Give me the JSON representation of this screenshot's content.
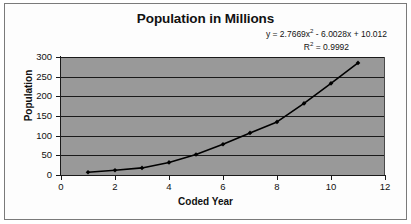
{
  "chart_data": {
    "type": "scatter",
    "title": "Population in Millions",
    "xlabel": "Coded Year",
    "ylabel": "Population",
    "xlim": [
      0,
      12
    ],
    "ylim": [
      0,
      300
    ],
    "xticks": [
      0,
      2,
      4,
      6,
      8,
      10,
      12
    ],
    "yticks": [
      0,
      50,
      100,
      150,
      200,
      250,
      300
    ],
    "xtick_labels": [
      "0",
      "2",
      "4",
      "6",
      "8",
      "10",
      "12"
    ],
    "ytick_labels": [
      "0",
      "50",
      "100",
      "150",
      "200",
      "250",
      "300"
    ],
    "grid": "horizontal",
    "legend": "none",
    "plot_background": "#999999",
    "series_color": "#000000",
    "marker": "diamond",
    "x": [
      1,
      2,
      3,
      4,
      5,
      6,
      7,
      8,
      9,
      10,
      11
    ],
    "values": [
      7,
      12,
      18,
      32,
      52,
      78,
      107,
      135,
      182,
      233,
      285
    ],
    "trendline": {
      "type": "polynomial",
      "order": 2,
      "a": 2.7669,
      "b": -6.0028,
      "c": 10.012,
      "r_squared": 0.9992,
      "equation_text": "y = 2.7669x2 - 6.0028x + 10.012",
      "r_squared_text": "R2 = 0.9992"
    },
    "annotations": {
      "equation_prefix": "y = 2.7669x",
      "equation_exponent": "2",
      "equation_suffix": " - 6.0028x + 10.012",
      "r2_prefix": "R",
      "r2_exponent": "2",
      "r2_suffix": " = 0.9992"
    }
  }
}
